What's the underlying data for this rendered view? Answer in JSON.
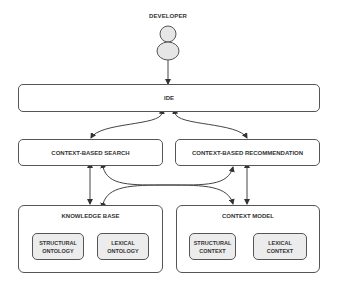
{
  "actor": {
    "label": "DEVELOPER",
    "icon": "person-icon"
  },
  "ide": {
    "label": "IDE"
  },
  "services": [
    {
      "label": "CONTEXT-BASED SEARCH"
    },
    {
      "label": "CONTEXT-BASED RECOMMENDATION"
    }
  ],
  "knowledge_base": {
    "title": "KNOWLEDGE BASE",
    "items": [
      {
        "label": "STRUCTURAL\nONTOLOGY"
      },
      {
        "label": "LEXICAL\nONTOLOGY"
      }
    ]
  },
  "context_model": {
    "title": "CONTEXT MODEL",
    "items": [
      {
        "label": "STRUCTURAL\nCONTEXT"
      },
      {
        "label": "LEXICAL\nCONTEXT"
      }
    ]
  },
  "colors": {
    "stroke": "#555555",
    "inner_fill": "#ececec",
    "actor_fill": "#e6e6e6"
  }
}
